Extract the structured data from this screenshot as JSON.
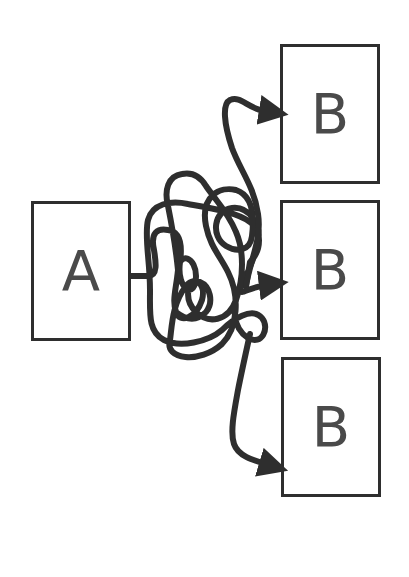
{
  "diagram": {
    "source": {
      "label": "A"
    },
    "targets": [
      {
        "label": "B"
      },
      {
        "label": "B"
      },
      {
        "label": "B"
      }
    ],
    "connector": "tangled-path",
    "colors": {
      "stroke": "#2e2e2e",
      "text": "#4a4a4a",
      "background": "#ffffff"
    }
  }
}
